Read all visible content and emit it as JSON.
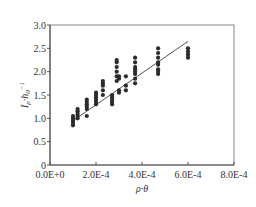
{
  "chart_data": {
    "type": "scatter",
    "title": "",
    "xlabel": "ρ·θ",
    "ylabel": "I_p·h_0^-1",
    "xlim": [
      0,
      0.0008
    ],
    "ylim": [
      0,
      3.0
    ],
    "x_ticks": [
      0,
      0.0002,
      0.0004,
      0.0006,
      0.0008
    ],
    "x_tick_labels": [
      "0.0E+0",
      "2.0E-4",
      "4.0E-4",
      "6.0E-4",
      "8.0E-4"
    ],
    "y_ticks": [
      0,
      0.5,
      1.0,
      1.5,
      2.0,
      2.5,
      3.0
    ],
    "y_tick_labels": [
      "0",
      "0.5",
      "1.0",
      "1.5",
      "2.0",
      "2.5",
      "3.0"
    ],
    "grid": false,
    "legend": null,
    "series": [
      {
        "name": "measured",
        "marker": "circle",
        "color": "#2b2b2b",
        "points": [
          [
            0.0001,
            0.85
          ],
          [
            0.0001,
            0.9
          ],
          [
            0.0001,
            0.95
          ],
          [
            0.0001,
            1.0
          ],
          [
            0.0001,
            1.05
          ],
          [
            0.00012,
            1.0
          ],
          [
            0.00012,
            1.05
          ],
          [
            0.00012,
            1.1
          ],
          [
            0.00012,
            1.15
          ],
          [
            0.00012,
            1.2
          ],
          [
            0.00016,
            1.05
          ],
          [
            0.00016,
            1.2
          ],
          [
            0.00016,
            1.25
          ],
          [
            0.00016,
            1.3
          ],
          [
            0.00016,
            1.35
          ],
          [
            0.00016,
            1.4
          ],
          [
            0.0002,
            1.3
          ],
          [
            0.0002,
            1.35
          ],
          [
            0.0002,
            1.4
          ],
          [
            0.0002,
            1.45
          ],
          [
            0.0002,
            1.5
          ],
          [
            0.0002,
            1.55
          ],
          [
            0.00023,
            1.5
          ],
          [
            0.00023,
            1.6
          ],
          [
            0.00023,
            1.7
          ],
          [
            0.00023,
            1.75
          ],
          [
            0.00023,
            1.8
          ],
          [
            0.00027,
            1.3
          ],
          [
            0.00027,
            1.35
          ],
          [
            0.00027,
            1.4
          ],
          [
            0.00027,
            1.45
          ],
          [
            0.00027,
            1.5
          ],
          [
            0.00029,
            1.8
          ],
          [
            0.00029,
            1.9
          ],
          [
            0.00029,
            2.0
          ],
          [
            0.00029,
            2.1
          ],
          [
            0.00029,
            2.2
          ],
          [
            0.00029,
            2.25
          ],
          [
            0.0003,
            1.55
          ],
          [
            0.0003,
            1.6
          ],
          [
            0.0003,
            1.85
          ],
          [
            0.0003,
            1.9
          ],
          [
            0.00033,
            1.6
          ],
          [
            0.00033,
            1.7
          ],
          [
            0.00033,
            1.9
          ],
          [
            0.00037,
            1.75
          ],
          [
            0.00037,
            1.85
          ],
          [
            0.00037,
            1.95
          ],
          [
            0.00037,
            2.0
          ],
          [
            0.00037,
            2.05
          ],
          [
            0.00037,
            2.1
          ],
          [
            0.00037,
            2.2
          ],
          [
            0.00037,
            2.3
          ],
          [
            0.00047,
            1.95
          ],
          [
            0.00047,
            2.0
          ],
          [
            0.00047,
            2.05
          ],
          [
            0.00047,
            2.15
          ],
          [
            0.00047,
            2.2
          ],
          [
            0.00047,
            2.3
          ],
          [
            0.00047,
            2.4
          ],
          [
            0.00047,
            2.5
          ],
          [
            0.0006,
            2.3
          ],
          [
            0.0006,
            2.37
          ],
          [
            0.0006,
            2.43
          ],
          [
            0.0006,
            2.5
          ]
        ]
      }
    ],
    "fit_line": {
      "name": "linear fit",
      "color": "#555555",
      "x": [
        0.0001,
        0.0006
      ],
      "y": [
        0.95,
        2.65
      ]
    }
  }
}
